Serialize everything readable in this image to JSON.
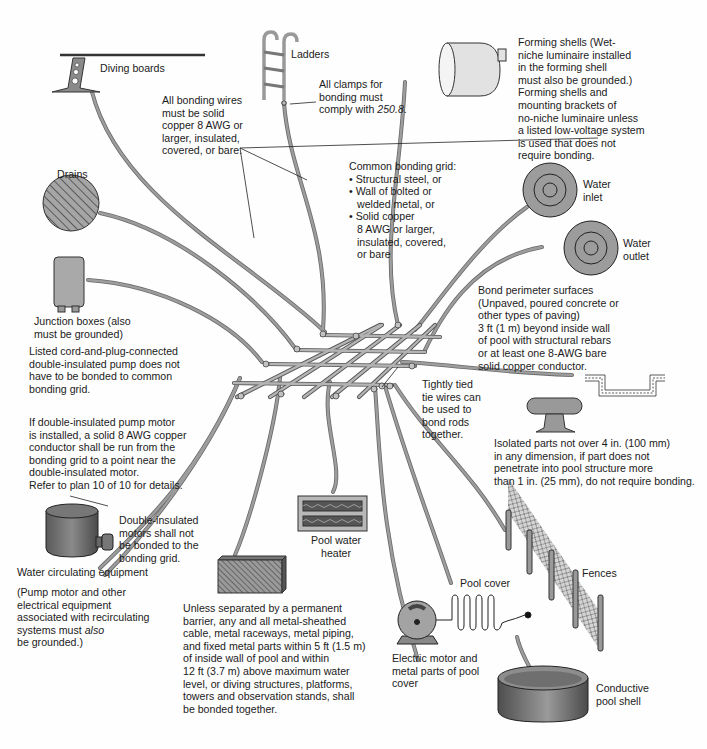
{
  "colors": {
    "wire": "#8c8c8c",
    "wire_edge": "#6a6a6a",
    "equipment_fill": "#a9a9a9",
    "equipment_dark": "#595959",
    "line": "#1a1a1a",
    "background": "#ffffff"
  },
  "components": {
    "diving_boards": "Diving boards",
    "ladders": "Ladders",
    "drains": "Drains",
    "junction_boxes": "Junction boxes (also\nmust be grounded)",
    "water_inlet": "Water\ninlet",
    "water_outlet": "Water\noutlet",
    "pool_water_heater": "Pool water\nheater",
    "water_circulating_equipment": "Water circulating equipment",
    "pool_cover": "Pool cover",
    "fences": "Fences",
    "electric_motor": "Electric motor and\nmetal parts of pool\ncover",
    "conductive_pool_shell": "Conductive\npool shell"
  },
  "notes": {
    "bonding_wires": "All bonding wires\nmust be solid\ncopper 8 AWG or\nlarger, insulated,\ncovered, or bare.",
    "clamps_prefix": "All clamps for\nbonding must\ncomply with ",
    "clamps_ref": "250.8",
    "clamps_suffix": ".",
    "forming_shells": "Forming shells (Wet-\nniche luminaire installed\nin the forming shell\nmust also be grounded.)\nForming shells and\nmounting brackets of\nno-niche luminaire unless\na listed low-voltage system\nis used that does not\nrequire bonding.",
    "common_grid_title": "Common bonding grid:",
    "common_grid_items": [
      "Structural steel, or",
      "Wall of bolted or\nwelded metal, or",
      "Solid copper\n8 AWG or larger,\ninsulated, covered,\nor bare"
    ],
    "perimeter": "Bond perimeter surfaces\n(Unpaved, poured concrete or\nother types of paving)\n 3 ft (1 m) beyond inside wall\nof pool with structural rebars\nor at least one 8-AWG bare\nsolid copper conductor.",
    "cord_plug_pump": "Listed cord-and-plug-connected\ndouble-insulated pump does not\nhave to be bonded to common\nbonding grid.",
    "tie_wires": "Tightly tied\ntie wires can\nbe used to\nbond rods\ntogether.",
    "double_insulated_pump": "If double-insulated pump motor\nis installed, a solid 8 AWG copper\nconductor shall be run from the\nbonding grid to a point near the\ndouble-insulated motor.\nRefer to plan 10 of 10 for details.",
    "isolated_parts": "Isolated parts not over 4 in. (100 mm)\nin any dimension, if part does not\npenetrate into pool structure more\nthan 1 in. (25 mm), do not require bonding.",
    "double_insulated_motors": "Double-insulated\nmotors shall not\nbe bonded to the\nbonding grid.",
    "recirculating_prefix": "(Pump motor and other\nelectrical equipment\nassociated with recirculating\nsystems must ",
    "recirculating_em": "also",
    "recirculating_suffix": "\nbe grounded.)",
    "metal_parts": "Unless separated by a permanent\nbarrier, any and all metal-sheathed\ncable, metal raceways, metal piping,\nand fixed metal parts within 5 ft (1.5 m)\nof inside wall of pool and within\n12 ft (3.7 m) above maximum water\nlevel, or diving structures, platforms,\ntowers and observation stands, shall\nbe bonded together."
  }
}
